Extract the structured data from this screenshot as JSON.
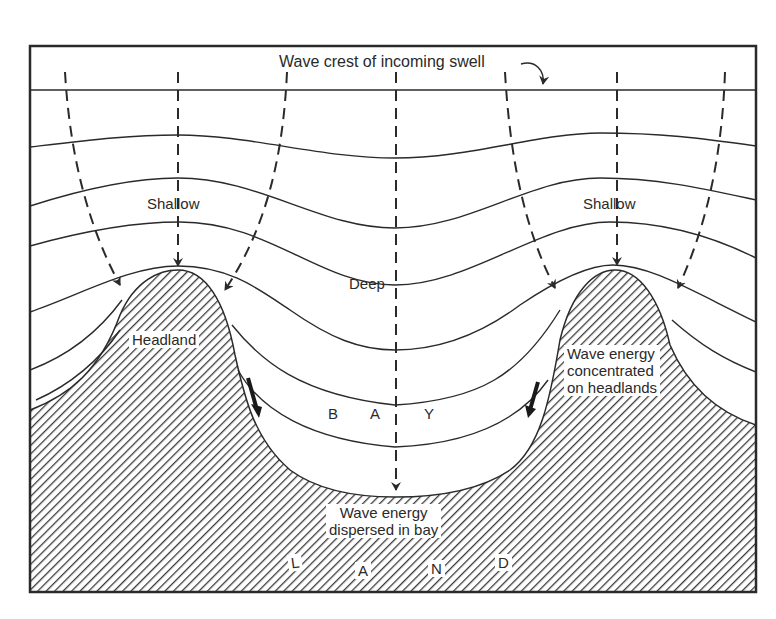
{
  "diagram": {
    "colors": {
      "ink": "#2a2a2a",
      "background": "#ffffff",
      "land_hatch": "#3a3a3a"
    },
    "labels": {
      "wave_crest": "Wave crest of incoming swell",
      "shallow_left": "Shallow",
      "shallow_right": "Shallow",
      "deep": "Deep",
      "headland": "Headland",
      "bay_letters": [
        "B",
        "A",
        "Y"
      ],
      "energy_concentrated": [
        "Wave energy",
        "concentrated",
        "on headlands"
      ],
      "energy_dispersed": [
        "Wave energy",
        "dispersed in bay"
      ],
      "land_letters": [
        "L",
        "A",
        "N",
        "D"
      ]
    },
    "elements": {
      "wave_crest_lines": 7,
      "orthogonal_arrows": 7,
      "longshore_arrows": 2,
      "headlands": 2,
      "bays": 1
    }
  }
}
